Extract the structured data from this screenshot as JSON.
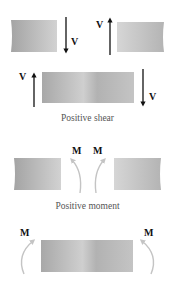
{
  "shear": {
    "caption": "Positive shear",
    "force_label": "V",
    "labels": [
      "V",
      "V",
      "V",
      "V"
    ]
  },
  "moment": {
    "caption": "Positive moment",
    "moment_label": "M",
    "labels": [
      "M",
      "M",
      "M",
      "M"
    ]
  },
  "colors": {
    "beam_light": "#d9d9d9",
    "beam_dark": "#9a9a9a",
    "arrow_dark": "#111111",
    "arrow_light": "#c8c8c8"
  }
}
